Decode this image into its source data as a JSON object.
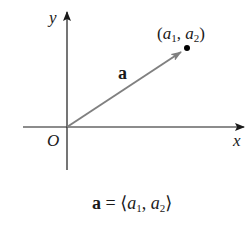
{
  "diagram": {
    "type": "vector-in-plane",
    "axes": {
      "x_label": "x",
      "y_label": "y",
      "origin_label": "O"
    },
    "vector": {
      "name": "a",
      "tail": "O",
      "tip_point_label": {
        "open": "(",
        "a1": "a",
        "a1_sub": "1",
        "sep": ", ",
        "a2": "a",
        "a2_sub": "2",
        "close": ")"
      },
      "color": "#808080"
    },
    "caption": {
      "lhs": "a",
      "eq": " = ⟨",
      "a1": "a",
      "a1_sub": "1",
      "sep": ", ",
      "a2": "a",
      "a2_sub": "2",
      "close": "⟩"
    },
    "colors": {
      "axis": "#1a1a1a",
      "vector": "#808080",
      "point": "#000000"
    }
  }
}
